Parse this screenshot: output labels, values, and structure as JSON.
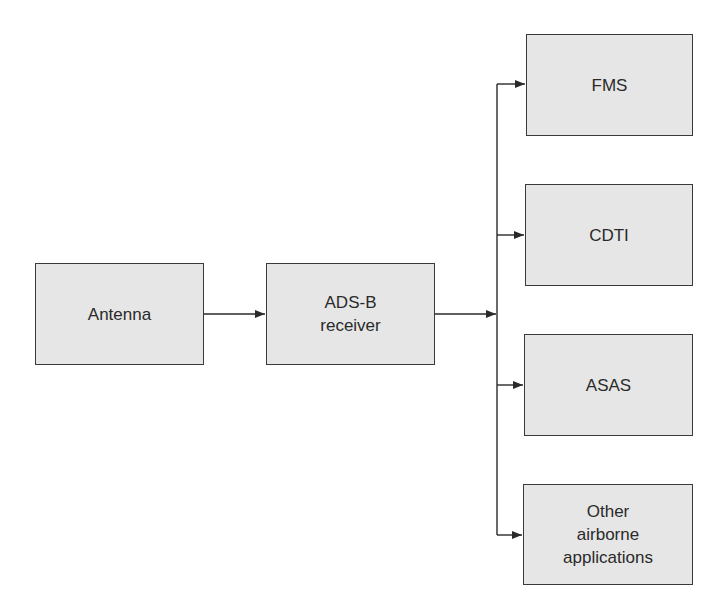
{
  "diagram": {
    "type": "block-diagram",
    "colors": {
      "box_fill": "#e6e6e6",
      "box_border": "#3a3a3a",
      "line": "#2a2a2a",
      "text": "#2a2a2a"
    },
    "nodes": [
      {
        "id": "antenna",
        "label": "Antenna"
      },
      {
        "id": "adsb_receiver",
        "label": "ADS-B\nreceiver",
        "lines": [
          "ADS-B",
          "receiver"
        ]
      },
      {
        "id": "fms",
        "label": "FMS"
      },
      {
        "id": "cdti",
        "label": "CDTI"
      },
      {
        "id": "asas",
        "label": "ASAS"
      },
      {
        "id": "other",
        "label": "Other\nairborne\napplications",
        "lines": [
          "Other",
          "airborne",
          "applications"
        ]
      }
    ],
    "edges": [
      {
        "from": "antenna",
        "to": "adsb_receiver"
      },
      {
        "from": "adsb_receiver",
        "to": "bus"
      },
      {
        "from": "bus",
        "to": "fms"
      },
      {
        "from": "bus",
        "to": "cdti"
      },
      {
        "from": "bus",
        "to": "asas"
      },
      {
        "from": "bus",
        "to": "other"
      }
    ]
  }
}
